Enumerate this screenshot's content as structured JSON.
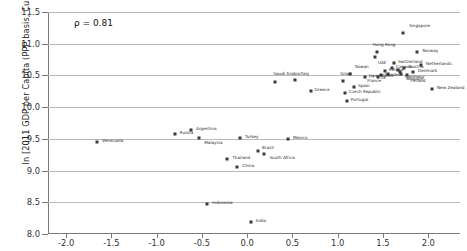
{
  "chart_data": {
    "type": "scatter",
    "title": "",
    "xlabel": "",
    "ylabel": "ln [2011 GDP per Capita (PPP basis, Current Intl $)]",
    "annotation": "ρ = 0.81",
    "xlim": [
      -2.2,
      2.35
    ],
    "ylim": [
      8.0,
      11.5
    ],
    "grid": "horizontal",
    "legend": "none",
    "xticks": [
      "-2.0",
      "-1.5",
      "-1.0",
      "-0.5",
      "0.0",
      "0.5",
      "1.0",
      "1.5",
      "2.0"
    ],
    "xtick_values": [
      -2.0,
      -1.5,
      -1.0,
      -0.5,
      0.0,
      0.5,
      1.0,
      1.5,
      2.0
    ],
    "yticks": [
      "8.0",
      "8.5",
      "9.0",
      "9.5",
      "10.0",
      "10.5",
      "11.0",
      "11.5"
    ],
    "ytick_values": [
      8.0,
      8.5,
      9.0,
      9.5,
      10.0,
      10.5,
      11.0,
      11.5
    ],
    "points": [
      {
        "label": "Singapore",
        "x": 1.72,
        "y": 11.17,
        "lx": 6,
        "ly": -9
      },
      {
        "label": "Hong Kong",
        "x": 1.43,
        "y": 10.87,
        "lx": -4,
        "ly": -9
      },
      {
        "label": "Norway",
        "x": 1.88,
        "y": 10.87,
        "lx": 5,
        "ly": -3
      },
      {
        "label": "UAE",
        "x": 1.41,
        "y": 10.79,
        "lx": 3,
        "ly": 4
      },
      {
        "label": "Switzerland",
        "x": 1.62,
        "y": 10.7,
        "lx": 4,
        "ly": -3
      },
      {
        "label": "Netherlands",
        "x": 1.92,
        "y": 10.67,
        "lx": 5,
        "ly": -3
      },
      {
        "label": "Canada",
        "x": 1.6,
        "y": 10.62,
        "lx": 4,
        "ly": -3
      },
      {
        "label": "Austria",
        "x": 1.73,
        "y": 10.61,
        "lx": 5,
        "ly": -3
      },
      {
        "label": "Sweden",
        "x": 1.66,
        "y": 10.58,
        "lx": -13,
        "ly": 3
      },
      {
        "label": "Ireland",
        "x": 1.52,
        "y": 10.57,
        "lx": 4,
        "ly": -3
      },
      {
        "label": "Germany",
        "x": 1.69,
        "y": 10.56,
        "lx": 5,
        "ly": 3
      },
      {
        "label": "Denmark",
        "x": 1.83,
        "y": 10.55,
        "lx": 5,
        "ly": -3
      },
      {
        "label": "Belgium",
        "x": 1.7,
        "y": 10.52,
        "lx": 5,
        "ly": 3
      },
      {
        "label": "Finland",
        "x": 1.76,
        "y": 10.5,
        "lx": 4,
        "ly": 4
      },
      {
        "label": "France",
        "x": 1.48,
        "y": 10.5,
        "lx": -14,
        "ly": 4
      },
      {
        "label": "UK",
        "x": 1.56,
        "y": 10.52,
        "lx": -8,
        "ly": 2
      },
      {
        "label": "Japan",
        "x": 1.3,
        "y": 10.48,
        "lx": 4,
        "ly": -3
      },
      {
        "label": "Korea",
        "x": 1.44,
        "y": 10.47,
        "lx": 4,
        "ly": -3
      },
      {
        "label": "Taiwan",
        "x": 1.14,
        "y": 10.52,
        "lx": 0,
        "ly": -9
      },
      {
        "label": "Israel",
        "x": 1.06,
        "y": 10.42,
        "lx": -3,
        "ly": -9
      },
      {
        "label": "Italy",
        "x": 0.53,
        "y": 10.43,
        "lx": 5,
        "ly": -8
      },
      {
        "label": "Saudi Arabia",
        "x": 0.31,
        "y": 10.4,
        "lx": -2,
        "ly": -10
      },
      {
        "label": "Spain",
        "x": 1.18,
        "y": 10.32,
        "lx": 4,
        "ly": -3
      },
      {
        "label": "New Zealand",
        "x": 2.04,
        "y": 10.28,
        "lx": 5,
        "ly": -3
      },
      {
        "label": "Czech Republic",
        "x": 1.08,
        "y": 10.22,
        "lx": 4,
        "ly": -3
      },
      {
        "label": "Greece",
        "x": 0.7,
        "y": 10.25,
        "lx": 4,
        "ly": -3
      },
      {
        "label": "Portugal",
        "x": 1.1,
        "y": 10.1,
        "lx": 4,
        "ly": -3
      },
      {
        "label": "Argentina",
        "x": -0.62,
        "y": 9.64,
        "lx": 5,
        "ly": -3
      },
      {
        "label": "Russia",
        "x": -0.8,
        "y": 9.58,
        "lx": 5,
        "ly": -3
      },
      {
        "label": "Malaysia",
        "x": -0.53,
        "y": 9.52,
        "lx": 5,
        "ly": 3
      },
      {
        "label": "Turkey",
        "x": -0.08,
        "y": 9.52,
        "lx": 5,
        "ly": -3
      },
      {
        "label": "Mexico",
        "x": 0.45,
        "y": 9.5,
        "lx": 5,
        "ly": -3
      },
      {
        "label": "Venezuela",
        "x": -1.66,
        "y": 9.45,
        "lx": 5,
        "ly": -3
      },
      {
        "label": "Brazil",
        "x": 0.12,
        "y": 9.31,
        "lx": 4,
        "ly": -5
      },
      {
        "label": "South Africa",
        "x": 0.19,
        "y": 9.26,
        "lx": 5,
        "ly": 2
      },
      {
        "label": "Thailand",
        "x": -0.22,
        "y": 9.18,
        "lx": 5,
        "ly": -3
      },
      {
        "label": "China",
        "x": -0.11,
        "y": 9.06,
        "lx": 5,
        "ly": -3
      },
      {
        "label": "Indonesia",
        "x": -0.44,
        "y": 8.48,
        "lx": 5,
        "ly": -3
      },
      {
        "label": "India",
        "x": 0.04,
        "y": 8.19,
        "lx": 5,
        "ly": -3
      }
    ]
  }
}
